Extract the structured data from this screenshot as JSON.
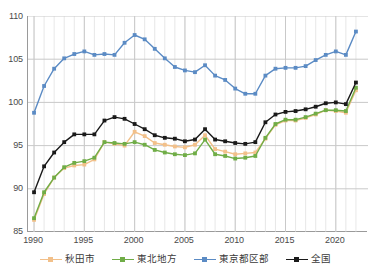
{
  "chart_data": {
    "type": "line",
    "title": "",
    "subtitle": "",
    "xlabel": "",
    "ylabel": "",
    "xlim": [
      1989.4,
      2023.2
    ],
    "ylim": [
      85,
      110
    ],
    "grid": true,
    "legend_position": "bottom",
    "x_tick_labels": [
      "1990",
      "1995",
      "2000",
      "2005",
      "2010",
      "2015",
      "2020"
    ],
    "x_tick_values": [
      1990,
      1995,
      2000,
      2005,
      2010,
      2015,
      2020
    ],
    "y_tick_labels": [
      "85",
      "90",
      "95",
      "100",
      "105",
      "110"
    ],
    "y_tick_values": [
      85,
      90,
      95,
      100,
      105,
      110
    ],
    "x": [
      1990,
      1991,
      1992,
      1993,
      1994,
      1995,
      1996,
      1997,
      1998,
      1999,
      2000,
      2001,
      2002,
      2003,
      2004,
      2005,
      2006,
      2007,
      2008,
      2009,
      2010,
      2011,
      2012,
      2013,
      2014,
      2015,
      2016,
      2017,
      2018,
      2019,
      2020,
      2021,
      2022
    ],
    "series": [
      {
        "name": "秋田市",
        "color": "#f2c08a",
        "marker": "square",
        "values": [
          86.4,
          89.4,
          91.3,
          92.4,
          92.7,
          92.8,
          93.4,
          95.4,
          95.2,
          95.0,
          96.6,
          96.1,
          95.3,
          95.1,
          94.9,
          94.8,
          95.1,
          96.2,
          94.6,
          94.3,
          94.0,
          94.1,
          94.2,
          95.8,
          97.4,
          97.9,
          97.9,
          98.2,
          98.6,
          99.1,
          99.0,
          98.8,
          101.4
        ]
      },
      {
        "name": "東北地方",
        "color": "#70ad47",
        "marker": "square",
        "values": [
          86.6,
          89.6,
          91.3,
          92.5,
          93.0,
          93.2,
          93.6,
          95.4,
          95.3,
          95.2,
          95.4,
          95.1,
          94.5,
          94.2,
          94.0,
          93.9,
          94.1,
          95.7,
          94.0,
          93.8,
          93.5,
          93.6,
          93.8,
          95.9,
          97.5,
          98.0,
          98.0,
          98.3,
          98.7,
          99.1,
          99.1,
          99.0,
          101.7
        ]
      },
      {
        "name": "東京都区部",
        "color": "#5b8bc4",
        "marker": "square",
        "values": [
          98.8,
          101.9,
          103.9,
          105.1,
          105.6,
          105.9,
          105.5,
          105.6,
          105.5,
          106.9,
          107.8,
          107.3,
          106.2,
          105.1,
          104.1,
          103.7,
          103.5,
          104.3,
          103.1,
          102.6,
          101.6,
          101.0,
          101.0,
          103.1,
          103.9,
          104.0,
          104.0,
          104.2,
          104.9,
          105.5,
          105.9,
          105.5,
          108.2
        ]
      },
      {
        "name": "全国",
        "color": "#1a1a1a",
        "marker": "square",
        "values": [
          89.6,
          92.6,
          94.2,
          95.4,
          96.3,
          96.3,
          96.3,
          97.9,
          98.3,
          98.1,
          97.5,
          96.9,
          96.2,
          95.9,
          95.8,
          95.5,
          95.7,
          96.9,
          95.7,
          95.5,
          95.3,
          95.2,
          95.4,
          97.7,
          98.6,
          98.9,
          99.0,
          99.2,
          99.5,
          99.9,
          100.0,
          99.8,
          102.3
        ]
      }
    ]
  },
  "legend": {
    "items": [
      {
        "label": "秋田市",
        "color": "#f2c08a"
      },
      {
        "label": "東北地方",
        "color": "#70ad47"
      },
      {
        "label": "東京都区部",
        "color": "#5b8bc4"
      },
      {
        "label": "全国",
        "color": "#1a1a1a"
      }
    ]
  },
  "axes": {
    "y_labels": [
      "110",
      "105",
      "100",
      "95",
      "90",
      "85"
    ],
    "x_labels": [
      "1990",
      "1995",
      "2000",
      "2005",
      "2010",
      "2015",
      "2020"
    ]
  },
  "colors": {
    "grid": "#c9c9c9",
    "minor_grid": "#dcdcdc",
    "axis": "#9a9a9a",
    "text": "#4a4a4a",
    "background": "#ffffff"
  }
}
